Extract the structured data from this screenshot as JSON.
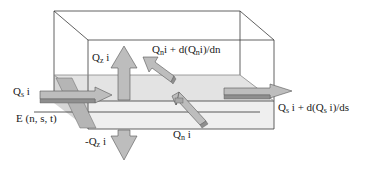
{
  "diagram": {
    "colors": {
      "background": "#ffffff",
      "lines": "#3a3a3a",
      "slab_top": "#e4e4e4",
      "slab_front": "#eeeeee",
      "arrow_fill": "#b8b8b8",
      "arrow_dark": "#8c8c8c",
      "arrow_stroke": "#555555"
    },
    "labels": {
      "qz_up": {
        "base": "Q",
        "sub": "z",
        "tail": " i"
      },
      "qn_out": {
        "base": "Q",
        "sub": "n",
        "tail": "i + d(Q",
        "sub2": "n",
        "tail2": "i)/dn"
      },
      "qs_in": {
        "base": "Q",
        "sub": "s",
        "tail": " i"
      },
      "qs_out": {
        "base": "Q",
        "sub": "s",
        "tail": " i + d(Q",
        "sub2": "s",
        "tail2": " i)/ds"
      },
      "e_point": {
        "text": "E (n, s, t)"
      },
      "qz_down": {
        "base": "-Q",
        "sub": "z",
        "tail": " i"
      },
      "qn_in": {
        "base": "Q",
        "sub": "n",
        "tail": " i"
      }
    }
  }
}
